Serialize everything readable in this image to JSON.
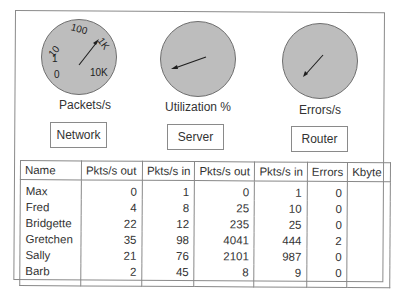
{
  "dials": [
    {
      "id": "network",
      "label": "Packets/s",
      "button_label": "Network",
      "scale_labels": [
        "0",
        "1",
        "10",
        "100",
        "1K",
        "10K"
      ],
      "needle": {
        "x1": 39,
        "y1": 47,
        "x2": 58,
        "y2": 22
      }
    },
    {
      "id": "server",
      "label": "Utilization %",
      "button_label": "Server",
      "scale_labels": [],
      "needle": {
        "x1": 45,
        "y1": 39,
        "x2": 15,
        "y2": 49
      }
    },
    {
      "id": "router",
      "label": "Errors/s",
      "button_label": "Router",
      "scale_labels": [],
      "needle": {
        "x1": 43,
        "y1": 31,
        "x2": 25,
        "y2": 52
      }
    }
  ],
  "colors": {
    "dial_fill": "#bdbdbd",
    "dial_border": "#6e6e6e",
    "needle": "#1e1e1e",
    "border": "#8a8a8a"
  },
  "table": {
    "headers": [
      "Name",
      "Pkts/s out",
      "Pkts/s in",
      "Pkts/s out",
      "Pkts/s in",
      "Errors",
      "Kbyte"
    ],
    "rows": [
      [
        "Max",
        "0",
        "1",
        "0",
        "1",
        "0",
        ""
      ],
      [
        "Fred",
        "4",
        "8",
        "25",
        "10",
        "0",
        ""
      ],
      [
        "Bridgette",
        "22",
        "12",
        "235",
        "25",
        "0",
        ""
      ],
      [
        "Gretchen",
        "35",
        "98",
        "4041",
        "444",
        "2",
        ""
      ],
      [
        "Sally",
        "21",
        "76",
        "2101",
        "987",
        "0",
        ""
      ],
      [
        "Barb",
        "2",
        "45",
        "8",
        "9",
        "0",
        ""
      ]
    ]
  }
}
